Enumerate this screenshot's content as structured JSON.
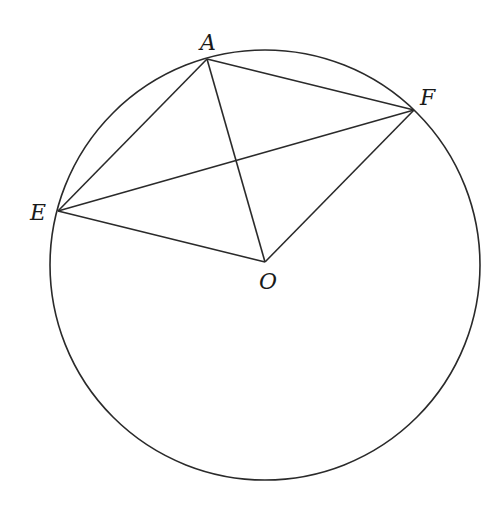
{
  "diagram": {
    "type": "circle-geometry",
    "stroke_color": "#2a2a2a",
    "background": "#ffffff",
    "circle": {
      "cx": 265,
      "cy": 265,
      "r": 215
    },
    "points": {
      "A": {
        "label": "A",
        "x": 207,
        "y": 59
      },
      "E": {
        "label": "E",
        "x": 58,
        "y": 211
      },
      "F": {
        "label": "F",
        "x": 414,
        "y": 110
      },
      "O": {
        "label": "O",
        "x": 265,
        "y": 262
      }
    },
    "segments": [
      [
        "A",
        "E"
      ],
      [
        "A",
        "F"
      ],
      [
        "A",
        "O"
      ],
      [
        "E",
        "F"
      ],
      [
        "E",
        "O"
      ],
      [
        "F",
        "O"
      ]
    ]
  }
}
